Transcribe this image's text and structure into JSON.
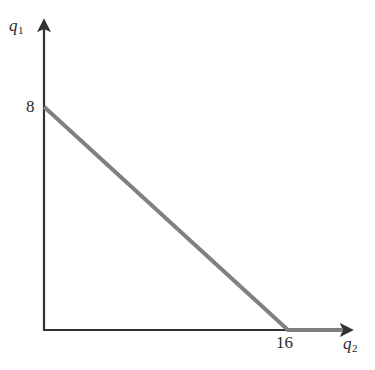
{
  "chart_data": {
    "type": "line",
    "title": "",
    "subtitle": "",
    "xlabel": "q2",
    "ylabel": "q1",
    "xlabel_display": "q",
    "xlabel_sub": "2",
    "ylabel_display": "q",
    "ylabel_sub": "1",
    "xlim": [
      0,
      20
    ],
    "ylim": [
      0,
      11
    ],
    "grid": false,
    "legend": null,
    "tick_labels": {
      "x": [
        "16"
      ],
      "y": [
        "8"
      ]
    },
    "annotations": [],
    "series": [
      {
        "name": "budget-constraint",
        "color": "#808080",
        "linewidth": 4,
        "points": [
          {
            "x": 0,
            "y": 8
          },
          {
            "x": 16,
            "y": 0
          },
          {
            "x": 19.6,
            "y": 0
          }
        ]
      }
    ],
    "axis_color": "#333333",
    "background_color": "#ffffff",
    "intercepts": {
      "vertical_axis_intercept": 8,
      "horizontal_axis_intercept": 16
    }
  },
  "axes": {
    "y": {
      "label_main": "q",
      "label_sub": "1",
      "arrow": "up-arrow-icon",
      "tick": {
        "value": "8"
      }
    },
    "x": {
      "label_main": "q",
      "label_sub": "2",
      "arrow": "right-arrow-icon",
      "tick": {
        "value": "16"
      }
    }
  },
  "colors": {
    "line": "#808080",
    "axis": "#333333",
    "text": "#2b2b2b",
    "background": "#ffffff"
  }
}
